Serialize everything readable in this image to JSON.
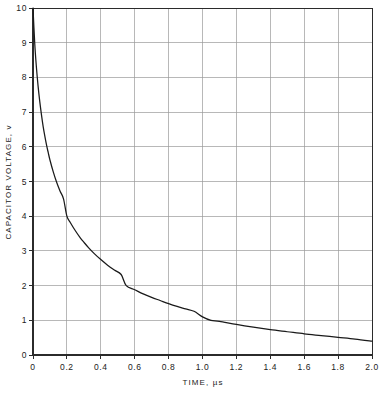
{
  "chart_data": {
    "type": "line",
    "title": "",
    "xlabel": "TIME, µs",
    "ylabel": "CAPACITOR VOLTAGE, v",
    "xlim": [
      0,
      2.0
    ],
    "ylim": [
      0,
      10
    ],
    "grid": true,
    "legend": null,
    "legend_position": "none",
    "xticks": [
      0,
      0.2,
      0.4,
      0.6,
      0.8,
      1.0,
      1.2,
      1.4,
      1.6,
      1.8,
      2.0
    ],
    "xtick_labels": [
      "0",
      "0.2",
      "0.4",
      "0.6",
      "0.8",
      "1.0",
      "1.2",
      "1.4",
      "1.6",
      "1.8",
      "2.0"
    ],
    "yticks": [
      0,
      1,
      2,
      3,
      4,
      5,
      6,
      7,
      8,
      9,
      10
    ],
    "ytick_labels": [
      "0",
      "1",
      "2",
      "3",
      "4",
      "5",
      "6",
      "7",
      "8",
      "9",
      "10"
    ],
    "series": [
      {
        "name": "capacitor voltage",
        "color": "#1a1a1a",
        "x": [
          0.0,
          0.01,
          0.02,
          0.03,
          0.04,
          0.05,
          0.06,
          0.07,
          0.08,
          0.09,
          0.1,
          0.12,
          0.14,
          0.16,
          0.18,
          0.2,
          0.22,
          0.25,
          0.28,
          0.3,
          0.33,
          0.36,
          0.4,
          0.44,
          0.48,
          0.52,
          0.55,
          0.6,
          0.65,
          0.7,
          0.75,
          0.8,
          0.85,
          0.9,
          0.95,
          1.0,
          1.05,
          1.1,
          1.2,
          1.3,
          1.4,
          1.5,
          1.6,
          1.7,
          1.8,
          1.9,
          2.0
        ],
        "y": [
          10.0,
          9.0,
          8.3,
          7.75,
          7.3,
          6.92,
          6.58,
          6.3,
          6.05,
          5.83,
          5.62,
          5.27,
          4.97,
          4.72,
          4.5,
          4.0,
          3.82,
          3.58,
          3.37,
          3.25,
          3.08,
          2.93,
          2.75,
          2.59,
          2.45,
          2.32,
          2.0,
          1.88,
          1.76,
          1.66,
          1.57,
          1.48,
          1.4,
          1.33,
          1.26,
          1.1,
          1.0,
          0.97,
          0.88,
          0.8,
          0.73,
          0.67,
          0.61,
          0.56,
          0.51,
          0.46,
          0.4
        ],
        "annotations": [
          {
            "x": 0.0,
            "y": 10.0,
            "note": "start at full charge"
          },
          {
            "x": 0.2,
            "y": 4.0,
            "note": "crosses 4 V near 0.2 µs"
          },
          {
            "x": 0.55,
            "y": 2.0,
            "note": "crosses 2 V near 0.55 µs"
          },
          {
            "x": 1.05,
            "y": 1.0,
            "note": "crosses 1 V near 1.05 µs"
          },
          {
            "x": 2.0,
            "y": 0.4,
            "note": "tail at 0.4 V"
          }
        ]
      }
    ],
    "colors": {
      "curve": "#1a1a1a",
      "axis": "#2b2b2b",
      "grid": "#9a9a9a",
      "background": "#ffffff",
      "text": "#222222"
    }
  }
}
